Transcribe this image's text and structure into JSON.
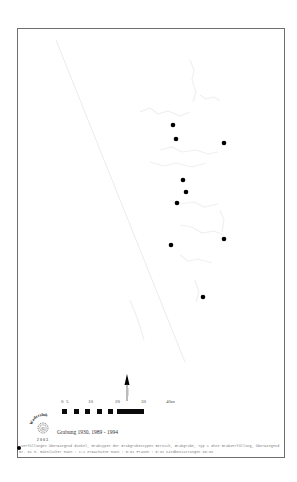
{
  "map": {
    "title": "Grabung 1930, 1989 - 1994",
    "frame_color": "#6e6e6e",
    "point_color": "#000000",
    "points": [
      {
        "x": 173,
        "y": 125
      },
      {
        "x": 176,
        "y": 139
      },
      {
        "x": 224,
        "y": 143
      },
      {
        "x": 183,
        "y": 180
      },
      {
        "x": 186,
        "y": 192
      },
      {
        "x": 177,
        "y": 203
      },
      {
        "x": 171,
        "y": 245
      },
      {
        "x": 224,
        "y": 239
      },
      {
        "x": 203,
        "y": 297
      }
    ]
  },
  "scale_bar": {
    "labels": [
      "0",
      "5",
      "10",
      "20",
      "30",
      "40m"
    ],
    "unit": "m"
  },
  "north_arrow": {
    "icon": "north-arrow-icon"
  },
  "logo": {
    "arc_text": "Wadersloh",
    "center_text": "83",
    "bottom_text": "2003"
  },
  "caption": "Grabung 1930, 1989 - 1994",
  "footnote": {
    "line1": "Verfüllungen überwiegend dunkel, Grabtypen der Grabgrubentypen Bereich, Grabgrube, Typ 1 ohne Grabverfüllung, überwiegend",
    "line2": "Nr. 81 M. männlicher Mann : 1:1 erwachsene Mann : 0:81 Frauen : 0:81 Kindbestattungen 88:8%"
  }
}
